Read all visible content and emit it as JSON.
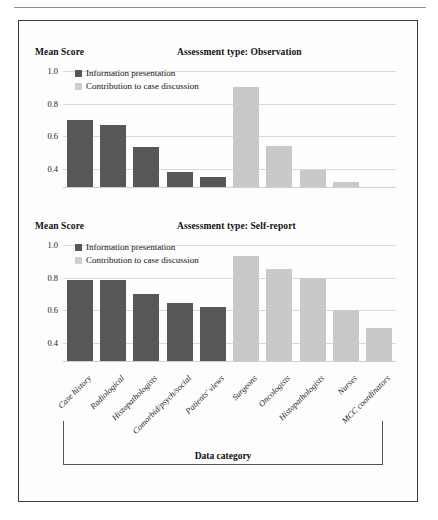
{
  "figure": {
    "x_axis_group_label": "Data category",
    "legend": [
      {
        "key": "information_presentation",
        "label": "Information presentation",
        "color": "#57575a"
      },
      {
        "key": "contribution_to_case_discussion",
        "label": "Contribution to case discussion",
        "color": "#c9c9c9"
      }
    ],
    "y_axis_label": "Mean Score",
    "panels": [
      {
        "key": "observation",
        "title": "Assessment type: Observation"
      },
      {
        "key": "self_report",
        "title": "Assessment type: Self-report"
      }
    ]
  },
  "chart_data": [
    {
      "type": "bar",
      "title": "Assessment type: Observation",
      "xlabel": "Data category",
      "ylabel": "Mean Score",
      "ylim": [
        0.28,
        1.05
      ],
      "yticks": [
        "1.0",
        "0.8",
        "0.6",
        "0.4"
      ],
      "ytick_values": [
        1.0,
        0.8,
        0.6,
        0.4
      ],
      "grid": true,
      "legend_position": "top-left",
      "categories": [
        "Case history",
        "Radiological",
        "Histopathologists",
        "Comorbid/psych/social",
        "Patients' views",
        "Surgeons",
        "Oncologists",
        "Histopathologists",
        "Nurses",
        "MCC coordinators"
      ],
      "series": [
        {
          "name": "Information presentation",
          "color": "#57575a",
          "categories": [
            "Case history",
            "Radiological",
            "Histopathologists",
            "Comorbid/psych/social",
            "Patients' views"
          ],
          "values": [
            0.7,
            0.67,
            0.53,
            0.38,
            0.35
          ]
        },
        {
          "name": "Contribution to case discussion",
          "color": "#c9c9c9",
          "categories": [
            "Surgeons",
            "Oncologists",
            "Histopathologists",
            "Nurses",
            "MCC coordinators"
          ],
          "values": [
            0.9,
            0.54,
            0.39,
            0.32
          ]
        }
      ]
    },
    {
      "type": "bar",
      "title": "Assessment type: Self-report",
      "xlabel": "Data category",
      "ylabel": "Mean Score",
      "ylim": [
        0.28,
        1.05
      ],
      "yticks": [
        "1.0",
        "0.8",
        "0.6",
        "0.4"
      ],
      "ytick_values": [
        1.0,
        0.8,
        0.6,
        0.4
      ],
      "grid": true,
      "legend_position": "top-left",
      "categories": [
        "Case history",
        "Radiological",
        "Histopathologists",
        "Comorbid/psych/social",
        "Patients' views",
        "Surgeons",
        "Oncologists",
        "Histopathologists",
        "Nurses",
        "MCC coordinators"
      ],
      "series": [
        {
          "name": "Information presentation",
          "color": "#57575a",
          "categories": [
            "Case history",
            "Radiological",
            "Histopathologists",
            "Comorbid/psych/social",
            "Patients' views"
          ],
          "values": [
            0.785,
            0.785,
            0.7,
            0.645,
            0.62
          ]
        },
        {
          "name": "Contribution to case discussion",
          "color": "#c9c9c9",
          "categories": [
            "Surgeons",
            "Oncologists",
            "Histopathologists",
            "Nurses",
            "MCC coordinators"
          ],
          "values": [
            0.935,
            0.85,
            0.795,
            0.6,
            0.49
          ]
        }
      ]
    }
  ]
}
